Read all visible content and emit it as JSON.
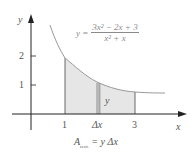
{
  "diagram": {
    "equation": {
      "lhs": "y =",
      "numerator": "3x² − 2x + 3",
      "denominator": "x² + x"
    },
    "axes": {
      "x_label": "x",
      "y_label": "y",
      "y_ticks": [
        "2",
        "1"
      ],
      "x_ticks": [
        "1",
        "Δx",
        "3"
      ]
    },
    "strip_label": "y",
    "area_formula": {
      "prefix": "A",
      "subscript": "rect.",
      "suffix": "= y Δx"
    },
    "colors": {
      "axis": "#222222",
      "curve": "#999999",
      "fill": "#e6e6e6",
      "strip": "#b8b8b8"
    }
  }
}
